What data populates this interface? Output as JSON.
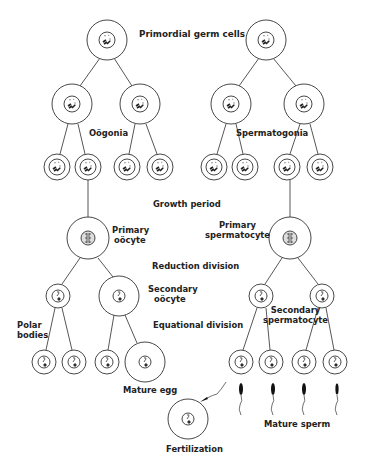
{
  "labels": {
    "primordial": "Primordial germ cells",
    "oogonia": "Oögonia",
    "spermatogonia": "Spermatogonia",
    "growth": "Growth period",
    "primary_oocyte_1": "Primary",
    "primary_oocyte_2": "oöcyte",
    "primary_sperm_1": "Primary",
    "primary_sperm_2": "spermatocyte",
    "reduction": "Reduction division",
    "secondary_oocyte_1": "Secondary",
    "secondary_oocyte_2": "oöcyte",
    "secondary_sperm_1": "Secondary",
    "secondary_sperm_2": "spermatocyte",
    "polar_1": "Polar",
    "polar_2": "bodies",
    "equational": "Equational division",
    "mature_egg": "Mature egg",
    "mature_sperm": "Mature sperm",
    "fertilization": "Fertilization"
  },
  "colors": {
    "line": "#333333",
    "fill": "#ffffff",
    "chromatin": "#222222"
  }
}
